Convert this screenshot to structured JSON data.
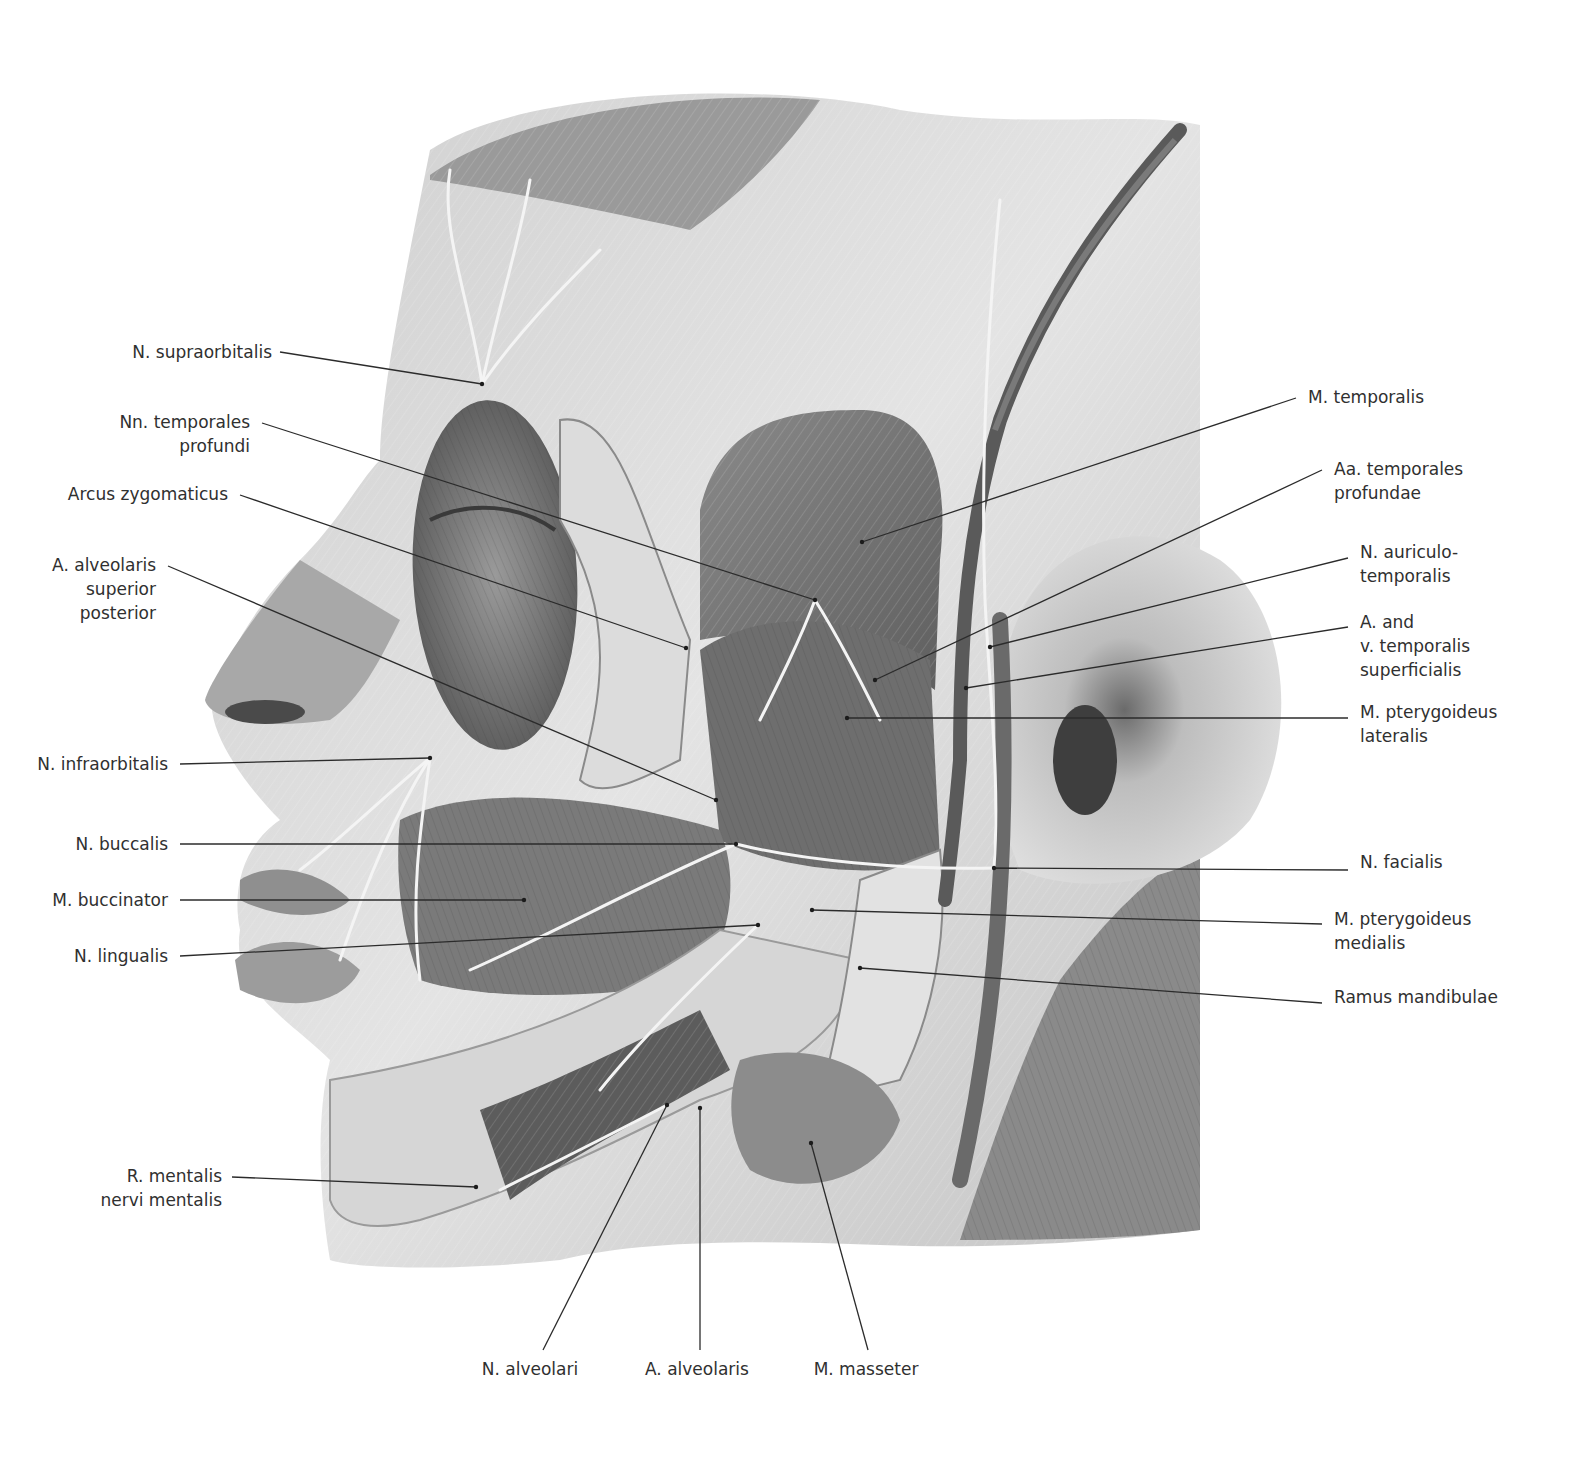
{
  "figure": {
    "type": "anatomical-illustration",
    "palette": {
      "background": "#ffffff",
      "skin_light": "#e6e6e6",
      "skin_mid": "#b8b8b8",
      "muscle_dark": "#7d7d7d",
      "vessel_dark": "#5a5a5a",
      "nerve_light": "#f2f2f2",
      "text": "#303030",
      "leader": "#2b2b2b"
    }
  },
  "labels": {
    "left": [
      {
        "id": "n-supraorbitalis",
        "text": "N. supraorbitalis",
        "x": 272,
        "y": 340,
        "anchor": [
          280,
          352
        ],
        "target": [
          482,
          384
        ]
      },
      {
        "id": "nn-temporales-profundi",
        "text": "Nn. temporales\nprofundi",
        "x": 250,
        "y": 410,
        "anchor": [
          262,
          423
        ],
        "target": [
          815,
          600
        ]
      },
      {
        "id": "arcus-zygomaticus",
        "text": "Arcus zygomaticus",
        "x": 228,
        "y": 482,
        "anchor": [
          240,
          495
        ],
        "target": [
          686,
          648
        ]
      },
      {
        "id": "a-alveolaris-superior-posterior",
        "text": "A. alveolaris\nsuperior\nposterior",
        "x": 156,
        "y": 553,
        "anchor": [
          168,
          566
        ],
        "target": [
          716,
          800
        ]
      },
      {
        "id": "n-infraorbitalis",
        "text": "N. infraorbitalis",
        "x": 168,
        "y": 752,
        "anchor": [
          180,
          764
        ],
        "target": [
          430,
          758
        ]
      },
      {
        "id": "n-buccalis",
        "text": "N. buccalis",
        "x": 168,
        "y": 832,
        "anchor": [
          180,
          844
        ],
        "target": [
          736,
          844
        ]
      },
      {
        "id": "m-buccinator",
        "text": "M. buccinator",
        "x": 168,
        "y": 888,
        "anchor": [
          180,
          900
        ],
        "target": [
          524,
          900
        ]
      },
      {
        "id": "n-lingualis",
        "text": "N. lingualis",
        "x": 168,
        "y": 944,
        "anchor": [
          180,
          956
        ],
        "target": [
          758,
          925
        ]
      },
      {
        "id": "r-mentalis-nervi-mentalis",
        "text": "R. mentalis\nnervi mentalis",
        "x": 222,
        "y": 1164,
        "anchor": [
          232,
          1177
        ],
        "target": [
          476,
          1187
        ]
      }
    ],
    "right": [
      {
        "id": "m-temporalis",
        "text": "M. temporalis",
        "x": 1308,
        "y": 385,
        "anchor": [
          1296,
          398
        ],
        "target": [
          862,
          542
        ]
      },
      {
        "id": "aa-temporales-profundae",
        "text": "Aa. temporales\nprofundae",
        "x": 1334,
        "y": 457,
        "anchor": [
          1322,
          470
        ],
        "target": [
          875,
          680
        ]
      },
      {
        "id": "n-auriculo-temporalis",
        "text": "N. auriculo-\ntemporalis",
        "x": 1360,
        "y": 540,
        "anchor": [
          1348,
          558
        ],
        "target": [
          990,
          647
        ]
      },
      {
        "id": "a-and-v-temporalis-superficialis",
        "text": "A. and\nv. temporalis\nsuperficialis",
        "x": 1360,
        "y": 610,
        "anchor": [
          1348,
          627
        ],
        "target": [
          966,
          688
        ]
      },
      {
        "id": "m-pterygoideus-lateralis",
        "text": "M. pterygoideus\nlateralis",
        "x": 1360,
        "y": 700,
        "anchor": [
          1348,
          718
        ],
        "target": [
          847,
          718
        ]
      },
      {
        "id": "n-facialis",
        "text": "N. facialis",
        "x": 1360,
        "y": 850,
        "anchor": [
          1348,
          870
        ],
        "target": [
          994,
          868
        ]
      },
      {
        "id": "m-pterygoideus-medialis",
        "text": "M. pterygoideus\nmedialis",
        "x": 1334,
        "y": 907,
        "anchor": [
          1322,
          924
        ],
        "target": [
          812,
          910
        ]
      },
      {
        "id": "ramus-mandibulae",
        "text": "Ramus mandibulae",
        "x": 1334,
        "y": 985,
        "anchor": [
          1322,
          1003
        ],
        "target": [
          860,
          968
        ]
      }
    ],
    "bottom": [
      {
        "id": "n-alveolaris-inferior",
        "text": "N. alveolari",
        "cut_off_line": "inferior",
        "x": 530,
        "y": 1357,
        "anchor": [
          543,
          1350
        ],
        "target": [
          667,
          1105
        ]
      },
      {
        "id": "a-alveolaris-inferior",
        "text": "A. alveolaris",
        "cut_off_line": "inferior",
        "x": 697,
        "y": 1357,
        "anchor": [
          700,
          1350
        ],
        "target": [
          700,
          1108
        ]
      },
      {
        "id": "m-masseter",
        "text": "M. masseter",
        "x": 866,
        "y": 1357,
        "anchor": [
          868,
          1350
        ],
        "target": [
          811,
          1143
        ]
      }
    ]
  }
}
